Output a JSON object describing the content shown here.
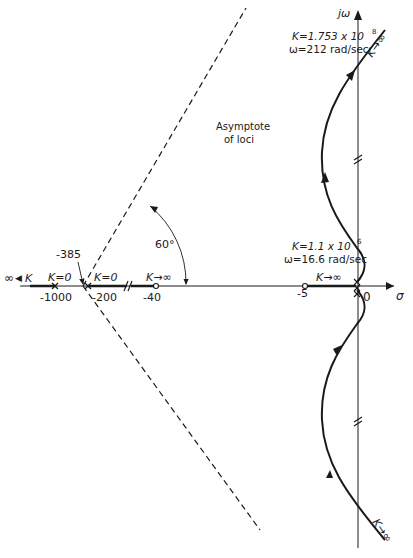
{
  "axes": {
    "imag_label": "jω",
    "real_label": "σ",
    "origin_label": "0"
  },
  "real_axis_ticks": {
    "m1000": "-1000",
    "m385": "-385",
    "m200": "-200",
    "m40": "-40",
    "m5": "-5"
  },
  "annotations": {
    "asymptote_line1": "Asymptote",
    "asymptote_line2": "of loci",
    "angle": "60°",
    "left_inf": "∞",
    "left_k": "K",
    "k0_a": "K=0",
    "k0_b": "K=0",
    "kinf_m40": "K→∞",
    "kinf_m5": "K→∞",
    "kinf_top": "K→∞",
    "kinf_bottom": "K→∞",
    "cross_top_k": "K=1.753 x 10",
    "cross_top_k_exp": "8",
    "cross_top_w": "ω=212 rad/sec",
    "cross_low_k": "K=1.1 x 10",
    "cross_low_k_exp": "6",
    "cross_low_w": "ω=16.6 rad/sec"
  },
  "poles": [
    -1000,
    -200,
    0,
    0
  ],
  "zeros": [
    -40,
    -5
  ],
  "colors": {
    "line": "#1a1a1a",
    "background": "#ffffff"
  }
}
